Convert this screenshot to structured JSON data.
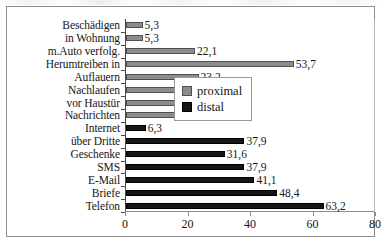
{
  "chart_data": {
    "type": "bar",
    "orientation": "horizontal",
    "title": "",
    "xlabel": "",
    "ylabel": "",
    "xlim": [
      0,
      80
    ],
    "xticks": [
      "0",
      "20",
      "40",
      "60",
      "80"
    ],
    "grid": false,
    "legend_position": "center-right",
    "categories": [
      "Beschädigen",
      "in Wohnung",
      "m.Auto verfolg.",
      "Herumtreiben in",
      "Auflauern",
      "Nachlaufen",
      "vor Haustür",
      "Nachrichten",
      "Internet",
      "über Dritte",
      "Geschenke",
      "SMS",
      "E-Mail",
      "Briefe",
      "Telefon"
    ],
    "values": [
      5.3,
      5.3,
      22.1,
      53.7,
      23.2,
      32.6,
      25.3,
      24.2,
      6.3,
      37.9,
      31.6,
      37.9,
      41.1,
      48.4,
      63.2
    ],
    "value_labels": [
      "5,3",
      "5,3",
      "22,1",
      "53,7",
      "23,2",
      "32,6",
      "25,3",
      "24,2",
      "6,3",
      "37,9",
      "31,6",
      "37,9",
      "41,1",
      "48,4",
      "63,2"
    ],
    "series_of": [
      "proximal",
      "proximal",
      "proximal",
      "proximal",
      "proximal",
      "proximal",
      "proximal",
      "proximal",
      "distal",
      "distal",
      "distal",
      "distal",
      "distal",
      "distal",
      "distal"
    ],
    "series": [
      {
        "name": "proximal",
        "color": "#8c8c8c"
      },
      {
        "name": "distal",
        "color": "#161616"
      }
    ]
  },
  "legend": {
    "items": [
      {
        "label": "proximal",
        "key": "proximal"
      },
      {
        "label": "distal",
        "key": "distal"
      }
    ]
  }
}
